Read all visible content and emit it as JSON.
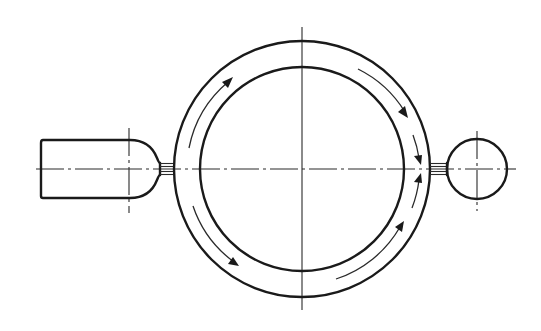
{
  "diagram": {
    "type": "technical-drawing",
    "colors": {
      "line": "#1a1a1a",
      "background": "#ffffff"
    },
    "components": [
      {
        "name": "inlet-pipe",
        "shape": "rounded rectangle",
        "side": "left"
      },
      {
        "name": "inlet-neck",
        "shape": "short double-line connector",
        "side": "left"
      },
      {
        "name": "annular-channel",
        "shape": "two concentric circles"
      },
      {
        "name": "outlet-neck",
        "shape": "short double-line connector",
        "side": "right"
      },
      {
        "name": "outlet-bulb",
        "shape": "small circle",
        "side": "right"
      }
    ],
    "flow_arrows": {
      "count": 6,
      "description": "Flow enters on the left, splits into upper and lower halves of the ring, and converges at the right outlet"
    },
    "centerlines": [
      "horizontal axis",
      "vertical axis of ring",
      "vertical axis of inlet nose",
      "vertical axis of outlet bulb"
    ]
  }
}
